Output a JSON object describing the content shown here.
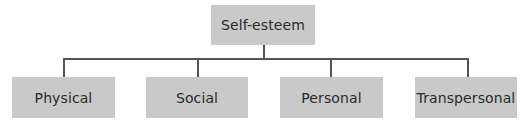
{
  "diagram": {
    "type": "hierarchy",
    "root": {
      "label": "Self-esteem"
    },
    "children": [
      {
        "label": "Physical"
      },
      {
        "label": "Social"
      },
      {
        "label": "Personal"
      },
      {
        "label": "Transpersonal"
      }
    ],
    "colors": {
      "node_fill": "#c9c9c9",
      "node_text": "#2a2a2a",
      "connector": "#555555",
      "background": "#ffffff"
    }
  }
}
